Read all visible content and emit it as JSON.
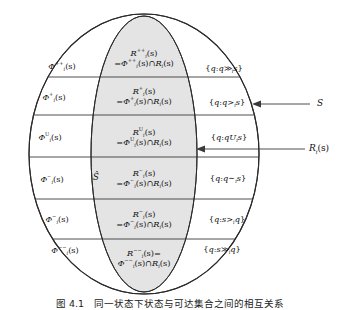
{
  "figure": {
    "caption": "图 4.1　同一状态下状态与可达集合之间的相互关系",
    "outer_set_label": "S",
    "inner_set_label": "R",
    "inner_set_label_sub": "i",
    "inner_set_label_arg": "(s)",
    "shat_label": "Ŝ",
    "shading_color": "#e4e4e4",
    "line_color": "#3a3a3a",
    "outline_color": "#2b2b2b"
  },
  "callouts": [
    {
      "name": "outer-circle-callout",
      "text": "S"
    },
    {
      "name": "inner-ellipse-callout",
      "text": "R",
      "sub": "i",
      "arg": "(s)"
    }
  ],
  "rows": [
    {
      "id": "strong-preference",
      "left": {
        "base": "Φ",
        "sup": "++",
        "sub": "i",
        "arg": "(s)"
      },
      "center_line1": {
        "base": "R",
        "sup": "++",
        "sub": "i",
        "arg": "(s)"
      },
      "center_line2": {
        "eq": "=",
        "base": "Φ",
        "sup": "++",
        "sub": "i",
        "arg": "(s)",
        "op": "∩",
        "base2": "R",
        "sub2": "i",
        "arg2": "(s)"
      },
      "right": {
        "open": "{",
        "var": "q",
        "colon": ":",
        "expr_left": "q",
        "rel": "≫",
        "rel_sub": "i",
        "expr_right": "s",
        "close": "}"
      }
    },
    {
      "id": "preference",
      "left": {
        "base": "Φ",
        "sup": "+",
        "sub": "i",
        "arg": "(s)"
      },
      "center_line1": {
        "base": "R",
        "sup": "+",
        "sub": "i",
        "arg": "(s)"
      },
      "center_line2": {
        "eq": "=",
        "base": "Φ",
        "sup": "+",
        "sub": "i",
        "arg": "(s)",
        "op": "∩",
        "base2": "R",
        "sub2": "i",
        "arg2": "(s)"
      },
      "right": {
        "open": "{",
        "var": "q",
        "colon": ":",
        "expr_left": "q",
        "rel": ">",
        "rel_sub": "i",
        "expr_right": "s",
        "close": "}"
      }
    },
    {
      "id": "uncertain",
      "left": {
        "base": "Φ",
        "sup": "U",
        "sub": "i",
        "arg": "(s)"
      },
      "center_line1": {
        "base": "R",
        "sup": "U",
        "sub": "i",
        "arg": "(s)"
      },
      "center_line2": {
        "eq": "=",
        "base": "Φ",
        "sup": "U",
        "sub": "i",
        "arg": "(s)",
        "op": "∩",
        "base2": "R",
        "sub2": "i",
        "arg2": "(s)"
      },
      "right": {
        "open": "{",
        "var": "q",
        "colon": ":",
        "expr_left": "q",
        "rel": "U",
        "rel_sub": "i",
        "expr_right": "s",
        "close": "}"
      }
    },
    {
      "id": "indifference",
      "left": {
        "base": "Φ",
        "sup": "∼",
        "sub": "i",
        "arg": "(s)"
      },
      "center_line1": {
        "base": "R",
        "sup": "∼",
        "sub": "i",
        "arg": "(s)"
      },
      "center_line2": {
        "eq": "=",
        "base": "Φ",
        "sup": "∼",
        "sub": "i",
        "arg": "(s)",
        "op": "∩",
        "base2": "R",
        "sub2": "i",
        "arg2": "(s)"
      },
      "right": {
        "open": "{",
        "var": "q",
        "colon": ":",
        "expr_left": "q",
        "rel": "∼",
        "rel_sub": "i",
        "expr_right": "s",
        "close": "}"
      }
    },
    {
      "id": "dispreference",
      "left": {
        "base": "Φ",
        "sup": "−",
        "sub": "i",
        "arg": "(s)"
      },
      "center_line1": {
        "base": "R",
        "sup": "−",
        "sub": "i",
        "arg": "(s)"
      },
      "center_line2": {
        "eq": "=",
        "base": "Φ",
        "sup": "−",
        "sub": "i",
        "arg": "(s)",
        "op": "∩",
        "base2": "R",
        "sub2": "i",
        "arg2": "(s)"
      },
      "right": {
        "open": "{",
        "var": "q",
        "colon": ":",
        "expr_left": "s",
        "rel": ">",
        "rel_sub": "i",
        "expr_right": "q",
        "close": "}"
      }
    },
    {
      "id": "strong-dispreference",
      "left": {
        "base": "Φ",
        "sup": "−−",
        "sub": "i",
        "arg": "(s)"
      },
      "center_line1": {
        "base": "R",
        "sup": "−−",
        "sub": "i",
        "arg": "(s)",
        "trailing_eq": "="
      },
      "center_line2": {
        "eq": "",
        "base": "Φ",
        "sup": "−−",
        "sub": "i",
        "arg": "(s)",
        "op": "∩",
        "base2": "R",
        "sub2": "i",
        "arg2": "(s)"
      },
      "right": {
        "open": "{",
        "var": "q",
        "colon": ":",
        "expr_left": "s",
        "rel": "≫",
        "rel_sub": "i",
        "expr_right": "q",
        "close": "}"
      }
    }
  ]
}
